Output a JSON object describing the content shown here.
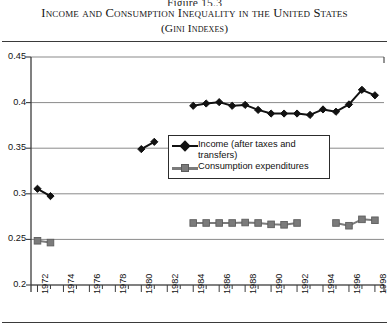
{
  "header": {
    "figure_number": "Figure 15.3",
    "title": "Income and Consumption Inequality in the United States",
    "subtitle": "(Gini Indexes)"
  },
  "chart_data": {
    "type": "line",
    "title": "Income and Consumption Inequality in the United States",
    "subtitle": "(Gini Indexes)",
    "xlabel": "",
    "ylabel": "",
    "xlim": [
      1971.5,
      1998.7
    ],
    "ylim": [
      0.2,
      0.45
    ],
    "yticks": [
      "0.2",
      "0.25",
      "0.3",
      "0.35",
      "0.4",
      "0.45"
    ],
    "ytick_values": [
      0.2,
      0.25,
      0.3,
      0.35,
      0.4,
      0.45
    ],
    "xticks": [
      "1972",
      "1974",
      "1976",
      "1978",
      "1980",
      "1982",
      "1984",
      "1986",
      "1988",
      "1990",
      "1992",
      "1994",
      "1996",
      "1998"
    ],
    "xtick_values": [
      1972,
      1974,
      1976,
      1978,
      1980,
      1982,
      1984,
      1986,
      1988,
      1990,
      1992,
      1994,
      1996,
      1998
    ],
    "grid": "horizontal",
    "legend_position": "center",
    "series": [
      {
        "name": "Income (after taxes and transfers)",
        "color": "#111111",
        "marker": "diamond",
        "segments": [
          {
            "x": [
              1972,
              1973
            ],
            "y": [
              0.3055,
              0.2975
            ]
          },
          {
            "x": [
              1980,
              1981
            ],
            "y": [
              0.349,
              0.357
            ]
          },
          {
            "x": [
              1984,
              1985,
              1986,
              1987,
              1988,
              1989,
              1990,
              1991,
              1992,
              1993,
              1994,
              1995,
              1996,
              1997,
              1998
            ],
            "y": [
              0.3965,
              0.399,
              0.4005,
              0.3965,
              0.3975,
              0.392,
              0.388,
              0.388,
              0.388,
              0.3865,
              0.3925,
              0.39,
              0.398,
              0.414,
              0.408
            ]
          }
        ]
      },
      {
        "name": "Consumption expenditures",
        "color": "#7b7b7b",
        "marker": "square",
        "segments": [
          {
            "x": [
              1972,
              1973
            ],
            "y": [
              0.2485,
              0.2465
            ]
          },
          {
            "x": [
              1984,
              1985,
              1986,
              1987,
              1988,
              1989,
              1990,
              1991,
              1992
            ],
            "y": [
              0.268,
              0.268,
              0.268,
              0.268,
              0.2685,
              0.268,
              0.2665,
              0.266,
              0.268
            ]
          },
          {
            "x": [
              1995,
              1996,
              1997,
              1998
            ],
            "y": [
              0.268,
              0.265,
              0.272,
              0.271
            ]
          }
        ]
      }
    ]
  },
  "legend": {
    "items": [
      {
        "label": "Income (after taxes and transfers)",
        "marker": "diamond",
        "color": "#111111"
      },
      {
        "label": "Consumption expenditures",
        "marker": "square",
        "color": "#7b7b7b"
      }
    ]
  }
}
